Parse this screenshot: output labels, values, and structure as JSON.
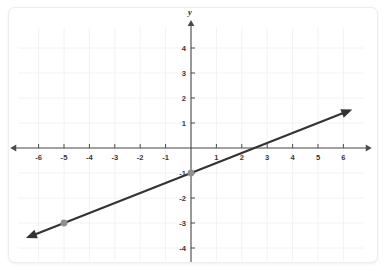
{
  "figure": {
    "name": "coordinate-plane-line-graph",
    "background_color": "#ffffff",
    "border_color": "#ededed"
  },
  "axes": {
    "x_label": "x",
    "y_label": "y",
    "axis_color": "#4a4a4a",
    "grid_color": "#f2f2f2",
    "x_range": [
      -6.8,
      6.8
    ],
    "y_range": [
      -4.5,
      4.8
    ],
    "x_tick_labels": [
      "-6",
      "-5",
      "-4",
      "-3",
      "-2",
      "-1",
      "1",
      "2",
      "3",
      "4",
      "5",
      "6"
    ],
    "x_tick_values": [
      -6,
      -5,
      -4,
      -3,
      -2,
      -1,
      1,
      2,
      3,
      4,
      5,
      6
    ],
    "y_tick_labels": [
      "4",
      "3",
      "2",
      "1",
      "-1",
      "-2",
      "-3",
      "-4"
    ],
    "y_tick_values": [
      4,
      3,
      2,
      1,
      -1,
      -2,
      -3,
      -4
    ],
    "tick_label_color": "#3b3b3b"
  },
  "chart_data": {
    "type": "line",
    "title": "",
    "xlabel": "x",
    "ylabel": "y",
    "xlim": [
      -6.8,
      6.8
    ],
    "ylim": [
      -4.5,
      4.8
    ],
    "grid": true,
    "legend": "none",
    "series": [
      {
        "name": "line",
        "equation": "y = 0.4x - 1",
        "slope": 0.4,
        "y_intercept": -1,
        "x_intercept": 2.5,
        "color": "#333333",
        "arrows": "both",
        "endpoints": [
          {
            "x": -6.5,
            "y": -3.6
          },
          {
            "x": 6.35,
            "y": 1.54
          }
        ],
        "points": [
          {
            "x": 0,
            "y": -1,
            "marker": "dot",
            "color": "#909090"
          },
          {
            "x": -5,
            "y": -3,
            "marker": "dot",
            "color": "#909090"
          }
        ]
      }
    ],
    "x_ticks": [
      -6,
      -5,
      -4,
      -3,
      -2,
      -1,
      1,
      2,
      3,
      4,
      5,
      6
    ],
    "y_ticks": [
      4,
      3,
      2,
      1,
      -1,
      -2,
      -3,
      -4
    ]
  }
}
